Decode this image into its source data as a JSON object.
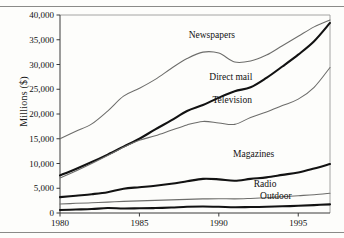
{
  "page": {
    "top_fragment": "",
    "background_color": "#fdfdfb"
  },
  "chart_data": {
    "type": "line",
    "title": "",
    "subtitle": "",
    "xlabel": "",
    "ylabel": "Millions ($)",
    "xlim": [
      1980,
      1997
    ],
    "ylim": [
      0,
      40000
    ],
    "grid": false,
    "legend_position": "inline-labels",
    "x_tick_labels": [
      "1980",
      "1985",
      "1990",
      "1995"
    ],
    "x_ticks": [
      1980,
      1985,
      1990,
      1995
    ],
    "y_tick_labels": [
      "0",
      "5,000",
      "10,000",
      "15,000",
      "20,000",
      "25,000",
      "30,000",
      "35,000",
      "40,000"
    ],
    "y_ticks": [
      0,
      5000,
      10000,
      15000,
      20000,
      25000,
      30000,
      35000,
      40000
    ],
    "x": [
      1980,
      1981,
      1982,
      1983,
      1984,
      1985,
      1986,
      1987,
      1988,
      1989,
      1990,
      1991,
      1992,
      1993,
      1994,
      1995,
      1996,
      1997
    ],
    "series": [
      {
        "name": "Newspapers",
        "style": "thin",
        "color": "#6d6d6b",
        "label_x": 1988.1,
        "label_y": 35400,
        "values": [
          15000,
          16500,
          18000,
          20600,
          23600,
          25200,
          27000,
          29200,
          31200,
          32500,
          32300,
          30500,
          30700,
          31900,
          33800,
          35700,
          37600,
          39000
        ]
      },
      {
        "name": "Direct mail",
        "style": "thick",
        "color": "#121212",
        "label_x": 1989.4,
        "label_y": 26900,
        "values": [
          7600,
          8900,
          10300,
          11800,
          13400,
          15000,
          16900,
          18700,
          20600,
          21800,
          23300,
          24600,
          25400,
          27300,
          29600,
          32000,
          34700,
          38400
        ]
      },
      {
        "name": "Television",
        "style": "thin",
        "color": "#6d6d6b",
        "label_x": 1989.6,
        "label_y": 22300,
        "values": [
          7100,
          8500,
          10000,
          11600,
          13300,
          14700,
          15600,
          16700,
          17800,
          18500,
          18200,
          17900,
          19300,
          20400,
          21700,
          23000,
          25400,
          29400
        ]
      },
      {
        "name": "Magazines",
        "style": "thick",
        "color": "#121212",
        "label_x": 1990.9,
        "label_y": 11300,
        "values": [
          3200,
          3500,
          3800,
          4200,
          4900,
          5200,
          5500,
          5900,
          6400,
          6900,
          6800,
          6500,
          6900,
          7200,
          7700,
          8200,
          9000,
          9900
        ]
      },
      {
        "name": "Radio",
        "style": "thin",
        "color": "#6d6d6b",
        "label_x": 1992.2,
        "label_y": 5200,
        "values": [
          1800,
          1950,
          2050,
          2200,
          2350,
          2450,
          2550,
          2650,
          2750,
          2850,
          2900,
          2850,
          2950,
          3100,
          3300,
          3500,
          3700,
          4000
        ]
      },
      {
        "name": "Outdoor",
        "style": "thick",
        "color": "#121212",
        "label_x": 1992.6,
        "label_y": 2750,
        "values": [
          600,
          700,
          800,
          1000,
          900,
          950,
          1000,
          1100,
          1250,
          1300,
          1250,
          1150,
          1200,
          1250,
          1350,
          1450,
          1600,
          1750
        ]
      }
    ]
  }
}
